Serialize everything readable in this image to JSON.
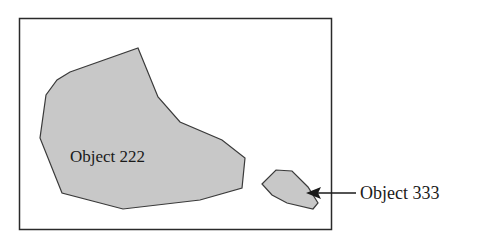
{
  "diagram": {
    "objects": [
      {
        "id": "object-222",
        "label": "Object 222",
        "fill": "#c8c8c8",
        "stroke": "#3a3a3a"
      },
      {
        "id": "object-333",
        "label": "Object 333",
        "fill": "#c8c8c8",
        "stroke": "#3a3a3a"
      }
    ],
    "frame_color": "#2a2a2a",
    "arrow_color": "#1a1a1a"
  }
}
